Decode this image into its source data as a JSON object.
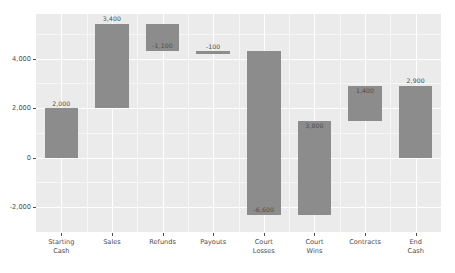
{
  "chart_data": {
    "type": "bar",
    "chart_style": "waterfall",
    "title": "",
    "subtitle": "",
    "xlabel": "",
    "ylabel": "",
    "categories": [
      "Starting\nCash",
      "Sales",
      "Refunds",
      "Payouts",
      "Court\nLosses",
      "Court\nWins",
      "Contracts",
      "End\nCash"
    ],
    "values": [
      2000,
      3400,
      -1100,
      -100,
      -6600,
      3800,
      1400,
      2900
    ],
    "data_labels": [
      "2,000",
      "3,400",
      "-1,100",
      "-100",
      "-6,600",
      "3,800",
      "1,400",
      "2,900"
    ],
    "bar_bottoms": [
      0,
      2000,
      4300,
      4200,
      -2300,
      -2300,
      1500,
      0
    ],
    "bar_tops": [
      2000,
      5400,
      5400,
      4300,
      4300,
      1500,
      2900,
      2900
    ],
    "label_positions": [
      "above",
      "above",
      "inside",
      "above",
      "inside-bottom",
      "inside-top",
      "inside-top",
      "above"
    ],
    "is_total": [
      true,
      false,
      false,
      false,
      false,
      false,
      false,
      true
    ],
    "ylim": [
      -3000,
      5800
    ],
    "yticks": [
      -2000,
      0,
      2000,
      4000
    ],
    "ytick_labels": [
      "-2,000",
      "0",
      "2,000",
      "4,000"
    ],
    "grid": true,
    "legend": "none",
    "bar_color": "#8c8c8c",
    "panel_color": "#ebebeb",
    "gridline_color": "#ffffff",
    "axis_text_color": "#4d4d4d"
  }
}
